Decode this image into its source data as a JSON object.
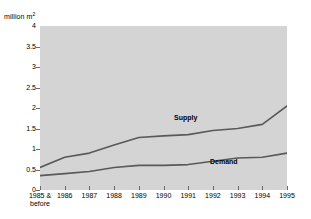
{
  "chart_data": {
    "type": "line",
    "title": "",
    "subtitle": "",
    "xlabel": "",
    "ylabel": "million m²",
    "ylim": [
      0,
      4
    ],
    "ytick_values": [
      0,
      0.5,
      1,
      1.5,
      2,
      2.5,
      3,
      3.5,
      4
    ],
    "ytick_labels": [
      "0",
      "0.5",
      "1",
      "1.5",
      "2",
      "2.5",
      "3",
      "3.5",
      "4"
    ],
    "grid": false,
    "legend_position": "inline-annotation",
    "categories": [
      "1985 & before",
      "1986",
      "1987",
      "1988",
      "1989",
      "1990",
      "1991",
      "1992",
      "1993",
      "1994",
      "1995"
    ],
    "xtick_labels_line1": [
      "1985 &",
      "1986",
      "1987",
      "1988",
      "1989",
      "1990",
      "1991",
      "1992",
      "1993",
      "1994",
      "1995"
    ],
    "xtick_labels_line2": [
      "before",
      "",
      "",
      "",
      "",
      "",
      "",
      "",
      "",
      "",
      ""
    ],
    "series": [
      {
        "name": "Supply",
        "color": "#595959",
        "values": [
          0.55,
          0.8,
          0.9,
          1.1,
          1.28,
          1.32,
          1.35,
          1.45,
          1.5,
          1.6,
          2.05
        ]
      },
      {
        "name": "Demand",
        "color": "#595959",
        "values": [
          0.35,
          0.4,
          0.45,
          0.55,
          0.6,
          0.6,
          0.62,
          0.7,
          0.78,
          0.8,
          0.9
        ]
      }
    ],
    "annotations": [
      {
        "text": "Supply",
        "series": "Supply"
      },
      {
        "text": "Demand",
        "series": "Demand"
      }
    ],
    "plot_background": "#d4d4d4",
    "page_background": "#ffffff",
    "axis_color": "#5a5a5a"
  },
  "axis": {
    "y_title_main": "million m",
    "y_title_sup": "2"
  },
  "labels": {
    "supply": "Supply",
    "demand": "Demand"
  }
}
